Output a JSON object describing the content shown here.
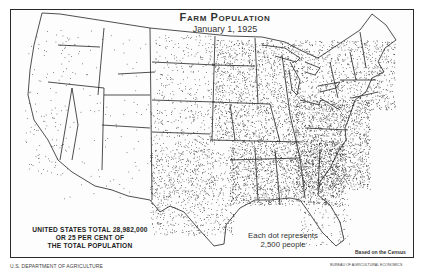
{
  "map": {
    "title": "Farm Population",
    "subtitle": "January 1, 1925",
    "total_note_lines": [
      "UNITED STATES TOTAL 28,982,000",
      "OR 25 PER CENT OF",
      "THE TOTAL POPULATION"
    ],
    "legend_lines": [
      "Each dot represents",
      "2,500 people"
    ],
    "source_note": "Based on the Census",
    "credit_left": "U.S. DEPARTMENT OF AGRICULTURE",
    "credit_right": "BUREAU OF AGRICULTURAL ECONOMICS",
    "dot_value": 2500,
    "total_farm_population": 28982000,
    "percent_of_total_population": 25,
    "colors": {
      "ink": "#1a1a1a",
      "paper": "#fdfdfd",
      "border": "#2a2a2a"
    },
    "density_regions": [
      {
        "name": "pacific-northwest",
        "x": [
          22,
          80
        ],
        "y": [
          30,
          80
        ],
        "density": 0.012
      },
      {
        "name": "california",
        "x": [
          25,
          70
        ],
        "y": [
          80,
          175
        ],
        "density": 0.02
      },
      {
        "name": "mountain-west",
        "x": [
          60,
          155
        ],
        "y": [
          30,
          200
        ],
        "density": 0.006
      },
      {
        "name": "great-plains-north",
        "x": [
          155,
          215
        ],
        "y": [
          35,
          110
        ],
        "density": 0.05
      },
      {
        "name": "great-plains-south",
        "x": [
          150,
          215
        ],
        "y": [
          110,
          200
        ],
        "density": 0.07
      },
      {
        "name": "texas",
        "x": [
          150,
          235
        ],
        "y": [
          150,
          235
        ],
        "density": 0.09
      },
      {
        "name": "corn-belt",
        "x": [
          215,
          300
        ],
        "y": [
          40,
          140
        ],
        "density": 0.16
      },
      {
        "name": "deep-south",
        "x": [
          230,
          345
        ],
        "y": [
          140,
          205
        ],
        "density": 0.22
      },
      {
        "name": "appalachia-southeast",
        "x": [
          295,
          370
        ],
        "y": [
          100,
          190
        ],
        "density": 0.24
      },
      {
        "name": "northeast",
        "x": [
          300,
          395
        ],
        "y": [
          40,
          110
        ],
        "density": 0.13
      },
      {
        "name": "florida",
        "x": [
          300,
          350
        ],
        "y": [
          190,
          245
        ],
        "density": 0.05
      }
    ]
  }
}
